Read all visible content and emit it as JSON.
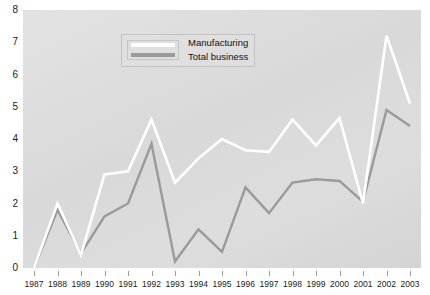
{
  "chart_data": {
    "type": "line",
    "title": "",
    "subtitle": "",
    "xlabel": "",
    "ylabel": "",
    "categories": [
      "1987",
      "1988",
      "1989",
      "1990",
      "1991",
      "1992",
      "1993",
      "1994",
      "1995",
      "1996",
      "1997",
      "1998",
      "1999",
      "2000",
      "2001",
      "2002",
      "2003"
    ],
    "series": [
      {
        "name": "Manufacturing",
        "color": "#ffffff",
        "values": [
          0.0,
          2.0,
          0.4,
          2.9,
          3.0,
          4.6,
          2.65,
          3.4,
          4.0,
          3.65,
          3.6,
          4.6,
          3.8,
          4.65,
          2.0,
          7.2,
          5.1
        ]
      },
      {
        "name": "Total business",
        "color": "#9a9a9a",
        "values": [
          0.0,
          1.8,
          0.45,
          1.6,
          2.0,
          3.85,
          0.2,
          1.2,
          0.5,
          2.5,
          1.7,
          2.65,
          2.75,
          2.7,
          2.05,
          4.9,
          4.4
        ]
      }
    ],
    "ylim": [
      0,
      8
    ],
    "yticks": [
      0,
      1,
      2,
      3,
      4,
      5,
      6,
      7,
      8
    ],
    "ytick_labels": [
      "0",
      "1",
      "2",
      "3",
      "4",
      "5",
      "6",
      "7",
      "8"
    ],
    "grid": false,
    "legend_position": "top-center",
    "plot_background": "#dcdcdc"
  }
}
